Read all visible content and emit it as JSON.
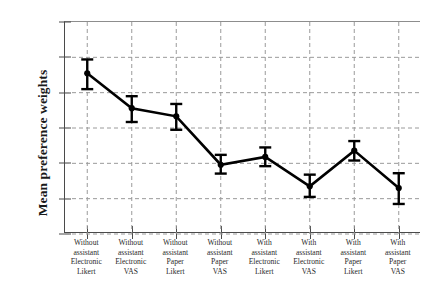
{
  "chart_data": {
    "type": "line",
    "title": "",
    "xlabel": "",
    "ylabel": "Mean preference weights",
    "ylim": [
      0.1,
      0.16
    ],
    "ytick_labels": [
      "0.16",
      "0.15",
      "0.14",
      "0.13",
      "0.12",
      "0.11",
      "0.10"
    ],
    "ytick_values": [
      0.16,
      0.15,
      0.14,
      0.13,
      0.12,
      0.11,
      0.1
    ],
    "grid": "dashed horizontal and vertical gridlines",
    "legend": "none",
    "error_bars": "vertical bars with horizontal caps",
    "marker": "filled circle",
    "categories": [
      "Without assistant Electronic Likert",
      "Without assistant Electronic VAS",
      "Without assistant Paper Likert",
      "Without assistant Paper VAS",
      "With assistant Electronic Likert",
      "With assistant Electronic VAS",
      "With assistant Paper Likert",
      "With assistant Paper VAS"
    ],
    "category_lines": [
      [
        "Without",
        "assistant",
        "Electronic",
        "Likert"
      ],
      [
        "Without",
        "assistant",
        "Electronic",
        "VAS"
      ],
      [
        "Without",
        "assistant",
        "Paper",
        "Likert"
      ],
      [
        "Without",
        "assistant",
        "Paper",
        "VAS"
      ],
      [
        "With",
        "assistant",
        "Electronic",
        "Likert"
      ],
      [
        "With",
        "assistant",
        "Electronic",
        "VAS"
      ],
      [
        "With",
        "assistant",
        "Paper",
        "Likert"
      ],
      [
        "With",
        "assistant",
        "Paper",
        "VAS"
      ]
    ],
    "values": [
      0.1455,
      0.1356,
      0.1333,
      0.1196,
      0.1218,
      0.1135,
      0.1236,
      0.113
    ],
    "err_low": [
      0.141,
      0.1317,
      0.1295,
      0.1171,
      0.1192,
      0.1105,
      0.1208,
      0.1085
    ],
    "err_high": [
      0.1494,
      0.139,
      0.1368,
      0.1224,
      0.1245,
      0.1168,
      0.1263,
      0.1172
    ]
  },
  "style": {
    "line_color": "#000000",
    "grid_color": "#9a9a9a",
    "axis_color": "#4a4a4a",
    "background": "#ffffff"
  }
}
